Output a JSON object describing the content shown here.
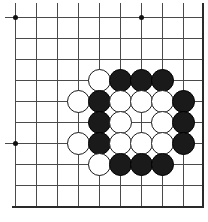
{
  "figure": {
    "kind": "go-board-diagram",
    "width": 208,
    "height": 222,
    "background_color": "#ffffff"
  },
  "board": {
    "grid_spacing": 21,
    "origin_x": 15,
    "origin_y": 17,
    "columns": 9,
    "rows": 9,
    "line_color": "#4a4a4a",
    "edge_color": "#2a2a2a",
    "line_width": 1,
    "edge_width": 2,
    "column_positions": [
      15,
      36,
      57,
      78,
      99,
      120,
      141,
      162,
      183
    ],
    "row_positions": [
      17,
      38,
      59,
      80,
      101,
      122,
      143,
      164,
      185
    ],
    "left_edge_x": 15,
    "right_edge_x": 202,
    "top_edge_y": 3,
    "bottom_edge_y": 206
  },
  "star_points": [
    {
      "name": "star-point-top-left",
      "x": 15,
      "y": 17
    },
    {
      "name": "star-point-top-right",
      "x": 141,
      "y": 17
    },
    {
      "name": "star-point-bottom-left",
      "x": 15,
      "y": 143
    }
  ],
  "stone_style": {
    "diameter": 23,
    "black_fill": "#1a1a1a",
    "black_border": "#000000",
    "white_fill": "#ffffff",
    "white_border": "#1a1a1a"
  },
  "stones": [
    {
      "color": "white",
      "x": 99,
      "y": 80
    },
    {
      "color": "black",
      "x": 120,
      "y": 80
    },
    {
      "color": "black",
      "x": 141,
      "y": 80
    },
    {
      "color": "black",
      "x": 162,
      "y": 80
    },
    {
      "color": "white",
      "x": 78,
      "y": 101
    },
    {
      "color": "black",
      "x": 99,
      "y": 101
    },
    {
      "color": "white",
      "x": 120,
      "y": 101
    },
    {
      "color": "white",
      "x": 141,
      "y": 101
    },
    {
      "color": "white",
      "x": 162,
      "y": 101
    },
    {
      "color": "black",
      "x": 183,
      "y": 101
    },
    {
      "color": "black",
      "x": 99,
      "y": 122
    },
    {
      "color": "white",
      "x": 120,
      "y": 122
    },
    {
      "color": "white",
      "x": 162,
      "y": 122
    },
    {
      "color": "black",
      "x": 183,
      "y": 122
    },
    {
      "color": "white",
      "x": 78,
      "y": 143
    },
    {
      "color": "black",
      "x": 99,
      "y": 143
    },
    {
      "color": "white",
      "x": 120,
      "y": 143
    },
    {
      "color": "white",
      "x": 141,
      "y": 143
    },
    {
      "color": "white",
      "x": 162,
      "y": 143
    },
    {
      "color": "black",
      "x": 183,
      "y": 143
    },
    {
      "color": "white",
      "x": 99,
      "y": 164
    },
    {
      "color": "black",
      "x": 120,
      "y": 164
    },
    {
      "color": "black",
      "x": 141,
      "y": 164
    },
    {
      "color": "black",
      "x": 162,
      "y": 164
    }
  ],
  "empty_intersections_inside_group": [
    {
      "x": 141,
      "y": 122
    }
  ],
  "counts": {
    "black_stones": 12,
    "white_stones": 12,
    "total_stones": 24
  }
}
